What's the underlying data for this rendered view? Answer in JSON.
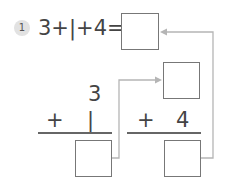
{
  "problem": {
    "number": "1",
    "equation": "3+|+4=",
    "colors": {
      "text": "#444444",
      "connector": "#b0b0b0",
      "box_border": "#777777",
      "badge_bg": "#e2e2e2"
    }
  },
  "left_column": {
    "top_operand": "3",
    "operator": "+",
    "bottom_operand": "|",
    "answer": ""
  },
  "right_column": {
    "top_operand": "",
    "operator": "+",
    "bottom_operand": "4",
    "answer": ""
  },
  "final_answer": ""
}
